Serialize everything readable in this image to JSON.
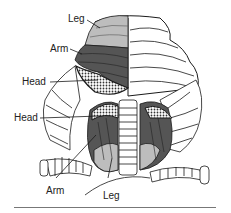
{
  "diagram": {
    "labels": {
      "upper_leg": "Leg",
      "upper_arm": "Arm",
      "upper_head": "Head",
      "lower_head": "Head",
      "lower_arm": "Arm",
      "lower_leg": "Leg"
    },
    "colors": {
      "leg": "#bdbdbd",
      "arm": "#555555",
      "head": "#9a9a9a",
      "outline": "#1a1a1a",
      "background": "#ffffff"
    }
  }
}
